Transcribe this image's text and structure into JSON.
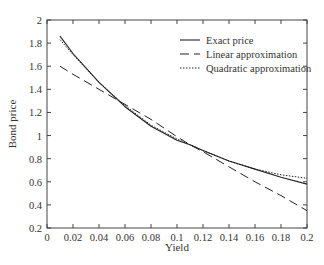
{
  "chart_data": {
    "type": "line",
    "title": "",
    "xlabel": "Yield",
    "ylabel": "Bond price",
    "xlim": [
      0,
      0.2
    ],
    "ylim": [
      0.2,
      2
    ],
    "grid": false,
    "legend_position": "upper right",
    "x_ticks": [
      "0",
      "0.02",
      "0.04",
      "0.06",
      "0.08",
      "0.1",
      "0.12",
      "0.14",
      "0.16",
      "0.18",
      "0.2"
    ],
    "y_ticks": [
      "0.2",
      "0.4",
      "0.6",
      "0.8",
      "1",
      "1.2",
      "1.4",
      "1.6",
      "1.8",
      "2"
    ],
    "x": [
      0.01,
      0.02,
      0.04,
      0.06,
      0.08,
      0.1,
      0.11,
      0.12,
      0.14,
      0.16,
      0.18,
      0.2
    ],
    "series": [
      {
        "name": "Exact price",
        "style": "solid",
        "values": [
          1.86,
          1.71,
          1.46,
          1.25,
          1.08,
          0.96,
          0.92,
          0.87,
          0.78,
          0.71,
          0.64,
          0.58
        ]
      },
      {
        "name": "Linear approximation",
        "style": "dashed",
        "values": [
          1.6,
          1.53,
          1.4,
          1.27,
          1.14,
          0.99,
          0.92,
          0.86,
          0.73,
          0.6,
          0.48,
          0.35
        ]
      },
      {
        "name": "Quadratic approximation",
        "style": "dotted",
        "values": [
          1.83,
          1.7,
          1.46,
          1.26,
          1.09,
          0.97,
          0.92,
          0.87,
          0.78,
          0.71,
          0.66,
          0.63
        ]
      }
    ]
  }
}
